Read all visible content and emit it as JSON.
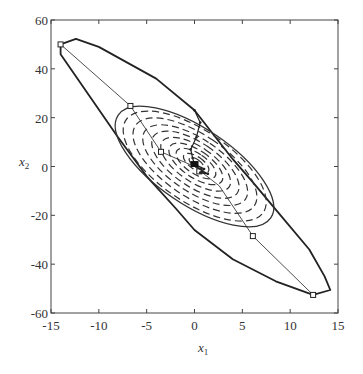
{
  "chart_data": {
    "type": "line",
    "title": "",
    "xlabel": "x",
    "xlabel_sub": "1",
    "ylabel": "x",
    "ylabel_sub": "2",
    "xlim": [
      -15,
      15
    ],
    "ylim": [
      -60,
      60
    ],
    "grid": false,
    "x_ticks": [
      -15,
      -10,
      -5,
      0,
      5,
      10,
      15
    ],
    "y_ticks": [
      -60,
      -40,
      -20,
      0,
      20,
      40,
      60
    ],
    "x_tick_labels": [
      "-15",
      "-10",
      "-5",
      "0",
      "5",
      "10",
      "15"
    ],
    "y_tick_labels": [
      "-60",
      "-40",
      "-20",
      "0",
      "20",
      "40",
      "60"
    ],
    "series": [
      {
        "name": "outer-region-boundary",
        "style": "solid-thick",
        "closed": true,
        "points": [
          [
            -14,
            50
          ],
          [
            -12.4,
            52.3
          ],
          [
            -10,
            49
          ],
          [
            -4,
            36
          ],
          [
            0,
            23
          ],
          [
            2,
            13
          ],
          [
            4,
            3
          ],
          [
            6,
            -6
          ],
          [
            9,
            -20
          ],
          [
            12,
            -34
          ],
          [
            13.6,
            -45
          ],
          [
            14.2,
            -50.6
          ],
          [
            12.4,
            -52.6
          ],
          [
            8.5,
            -47
          ],
          [
            4,
            -38
          ],
          [
            0,
            -26
          ],
          [
            -2,
            -17
          ],
          [
            -5,
            -4
          ],
          [
            -8,
            12
          ],
          [
            -11,
            29
          ],
          [
            -14,
            46
          ]
        ]
      },
      {
        "name": "inner-region-ellipse",
        "style": "solid",
        "closed": true,
        "ellipse": {
          "cx": 0,
          "cy": 0,
          "semi_major_px": 92,
          "semi_minor_px": 38,
          "angle_deg": 62
        }
      },
      {
        "name": "level-set-contours",
        "style": "dashed",
        "ellipses": [
          {
            "scale": 0.9
          },
          {
            "scale": 0.78
          },
          {
            "scale": 0.66
          },
          {
            "scale": 0.55
          },
          {
            "scale": 0.44
          },
          {
            "scale": 0.34
          },
          {
            "scale": 0.25
          },
          {
            "scale": 0.16
          },
          {
            "scale": 0.09
          }
        ]
      },
      {
        "name": "principal-direction",
        "style": "thin",
        "points": [
          [
            -14,
            50
          ],
          [
            -6.7,
            24.8
          ],
          [
            -3.5,
            6
          ],
          [
            0,
            0
          ],
          [
            2.6,
            -8
          ],
          [
            6.1,
            -28.5
          ],
          [
            12.4,
            -52.6
          ]
        ],
        "markers": [
          [
            -14,
            50
          ],
          [
            -6.7,
            24.8
          ],
          [
            -3.5,
            6
          ],
          [
            0.5,
            -2
          ],
          [
            6.1,
            -28.5
          ],
          [
            12.4,
            -52.6
          ]
        ]
      },
      {
        "name": "trajectory",
        "style": "solid-dotted",
        "points": [
          [
            0,
            23
          ],
          [
            0.6,
            18
          ],
          [
            0.2,
            12
          ],
          [
            -0.4,
            7
          ],
          [
            -0.2,
            3.5
          ],
          [
            0,
            1
          ],
          [
            1,
            -1
          ],
          [
            0.6,
            -2.5
          ],
          [
            1.4,
            -3
          ],
          [
            0.8,
            -1.8
          ],
          [
            0,
            0.5
          ]
        ]
      }
    ]
  }
}
